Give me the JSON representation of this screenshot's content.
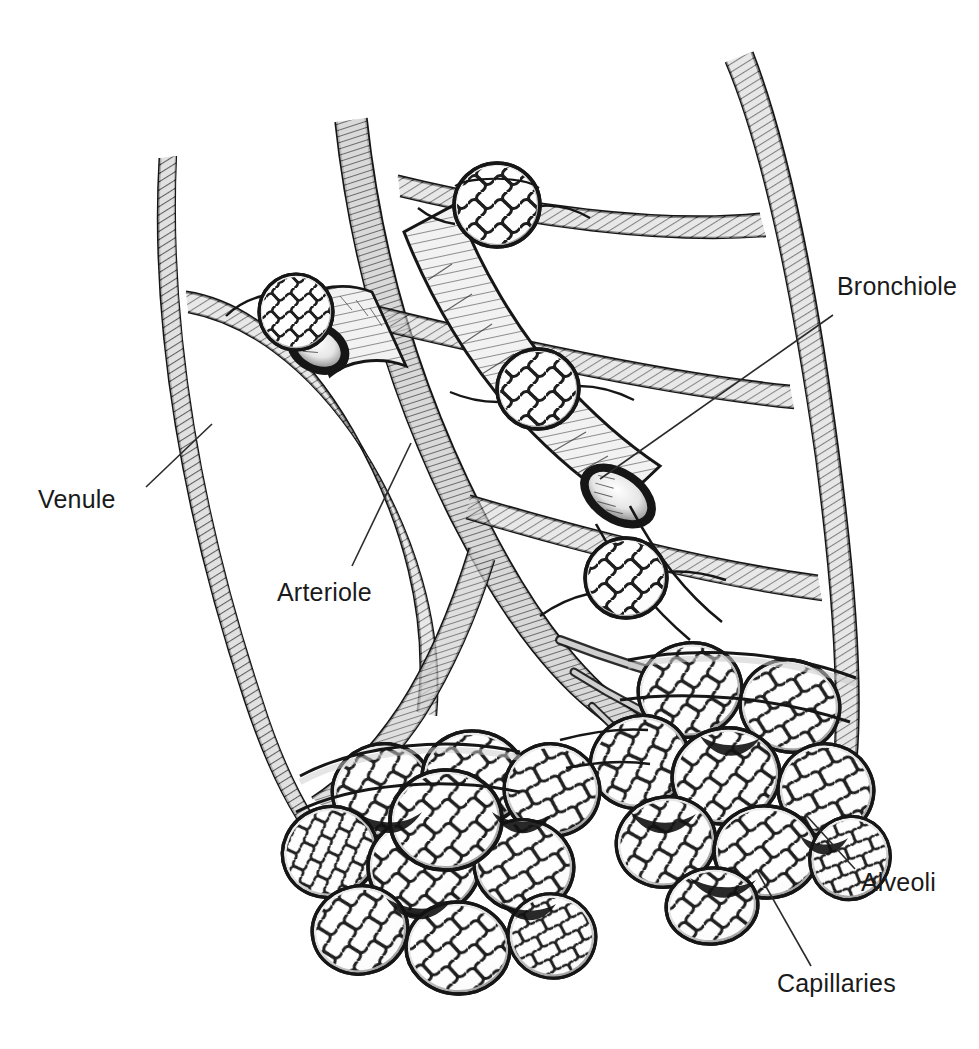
{
  "figure": {
    "style": "black-and-white pen-and-ink medical line illustration",
    "background_color": "#ffffff",
    "ink_color": "#1a1a1a",
    "vessel_fill_color": "#c9c9c9",
    "capillary_fill_color": "#b5b5b5",
    "width": 979,
    "height": 1049
  },
  "labels": [
    {
      "id": "venule",
      "text": "Venule",
      "text_x": 38,
      "text_y": 508,
      "leader": {
        "x1": 146,
        "y1": 487,
        "x2": 212,
        "y2": 424
      }
    },
    {
      "id": "arteriole",
      "text": "Arteriole",
      "text_x": 277,
      "text_y": 601,
      "leader": {
        "x1": 352,
        "y1": 566,
        "x2": 411,
        "y2": 443
      }
    },
    {
      "id": "bronchiole",
      "text": "Bronchiole",
      "text_x": 837,
      "text_y": 295,
      "leader": {
        "x1": 833,
        "y1": 315,
        "x2": 600,
        "y2": 479
      }
    },
    {
      "id": "alveoli",
      "text": "Alveoli",
      "text_x": 861,
      "text_y": 891,
      "leader": {
        "x1": 855,
        "y1": 869,
        "x2": 806,
        "y2": 815
      }
    },
    {
      "id": "capillaries",
      "text": "Capillaries",
      "text_x": 777,
      "text_y": 992,
      "leader": {
        "x1": 811,
        "y1": 966,
        "x2": 756,
        "y2": 869
      }
    }
  ],
  "structures": {
    "bronchiole_main": {
      "name": "Bronchiole",
      "description": "Large cut-open airway tube running from upper centre down to lower right, shown with an open elliptical lumen",
      "count": 1
    },
    "bronchiole_branch": {
      "name": "Bronchiole branch",
      "description": "Second cut-open airway tube at upper left with visible elliptical lumen",
      "count": 1
    },
    "venule": {
      "name": "Venule",
      "description": "Long hatched vessel descending on the far left of the figure",
      "count": 1
    },
    "arteriole": {
      "name": "Arteriole",
      "description": "Hatched vessel descending through the centre of the figure feeding the capillary beds",
      "count": 1
    },
    "single_alveoli": {
      "name": "Single alveoli on bronchiole wall",
      "description": "Isolated spherical alveoli wrapped in capillary mesh attached along the airway",
      "count": 4
    },
    "alveolar_sacs": {
      "name": "Alveolar sacs",
      "description": "Two terminal grape-like clusters of alveoli, each alveolus covered by a dense capillary net",
      "count": 2
    }
  },
  "typography": {
    "label_font_size_px": 25,
    "label_color": "#1a1a1a"
  }
}
